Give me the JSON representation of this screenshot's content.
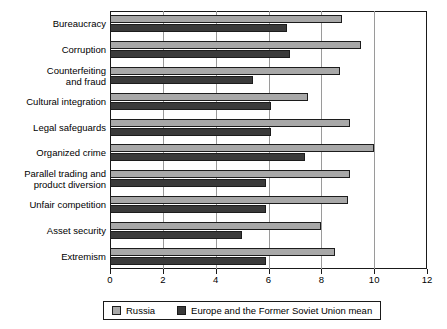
{
  "chart_data": {
    "type": "bar",
    "orientation": "horizontal",
    "title": "",
    "subtitle": "",
    "xlabel": "",
    "ylabel": "",
    "xlim": [
      0,
      12
    ],
    "xticks": [
      0,
      2,
      4,
      6,
      8,
      10,
      12
    ],
    "xtick_labels": [
      "0",
      "2",
      "4",
      "6",
      "8",
      "10",
      "12"
    ],
    "grid": "vertical",
    "legend_position": "bottom",
    "categories": [
      "Bureaucracy",
      "Corruption",
      "Counterfeiting\nand fraud",
      "Cultural integration",
      "Legal safeguards",
      "Organized crime",
      "Parallel trading and\nproduct diversion",
      "Unfair competition",
      "Asset security",
      "Extremism"
    ],
    "series": [
      {
        "name": "Russia",
        "color": "#a8a8a8",
        "values": [
          8.8,
          9.5,
          8.7,
          7.5,
          9.1,
          10.0,
          9.1,
          9.0,
          8.0,
          8.5
        ]
      },
      {
        "name": "Europe and the Former Soviet Union mean",
        "color": "#3a3a3a",
        "values": [
          6.7,
          6.8,
          5.4,
          6.1,
          6.1,
          7.4,
          5.9,
          5.9,
          5.0,
          5.9
        ]
      }
    ]
  },
  "legend": {
    "entries": [
      {
        "label": "Russia",
        "swatch": "light-gray-swatch"
      },
      {
        "label": "Europe and the Former Soviet Union mean",
        "swatch": "dark-gray-swatch"
      }
    ]
  },
  "colors": {
    "series_russia": "#a8a8a8",
    "series_europe_fsu_mean": "#3a3a3a",
    "axis": "#1a1a1a",
    "grid": "#9a9a9a",
    "background": "#ffffff"
  }
}
